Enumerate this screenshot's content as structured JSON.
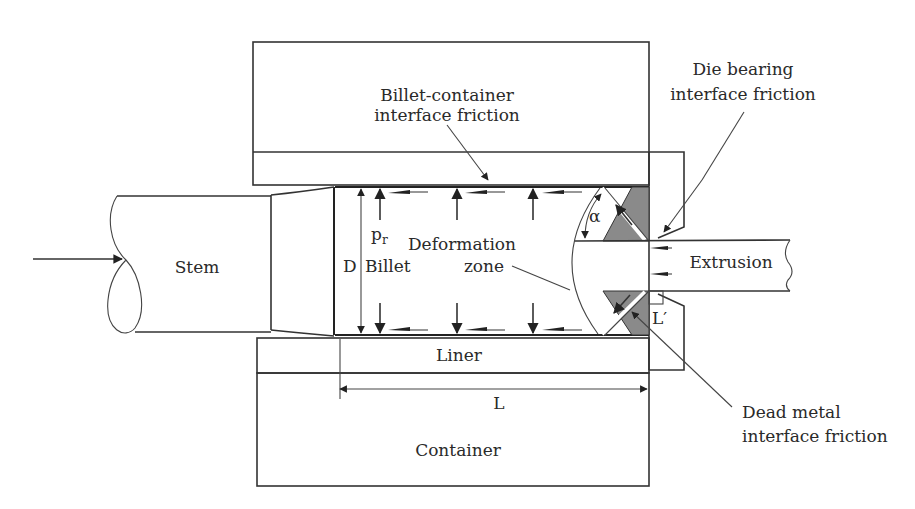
{
  "figure": {
    "colors": {
      "line": "#333333",
      "dead_metal_fill": "#8a8a8a",
      "background": "#ffffff",
      "text": "#2a2a2a"
    }
  },
  "labels": {
    "billet_container_friction_line1": "Billet-container",
    "billet_container_friction_line2": "interface friction",
    "die_bearing_friction_line1": "Die bearing",
    "die_bearing_friction_line2": "interface friction",
    "dead_metal_friction_line1": "Dead metal",
    "dead_metal_friction_line2": "interface friction",
    "stem": "Stem",
    "billet": "Billet",
    "diameter": "D",
    "pressure": "p",
    "pressure_subscript": "r",
    "deformation_zone_line1": "Deformation",
    "deformation_zone_line2": "zone",
    "alpha": "α",
    "extrusion": "Extrusion",
    "bearing_length": "L′",
    "liner": "Liner",
    "length": "L",
    "container": "Container"
  }
}
